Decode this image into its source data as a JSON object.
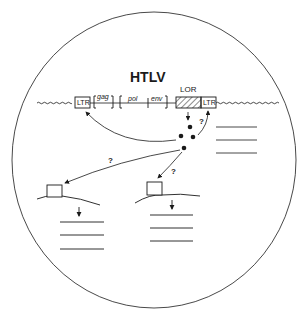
{
  "diagram": {
    "title": "HTLV",
    "genome": {
      "ltr_left": "LTR",
      "ltr_right": "LTR",
      "genes": [
        "gag",
        "pol",
        "env"
      ],
      "lor_label": "LOR"
    },
    "question_marks": [
      "?",
      "?",
      "?"
    ],
    "colors": {
      "ink": "#1a1a1a",
      "background": "#ffffff"
    }
  }
}
